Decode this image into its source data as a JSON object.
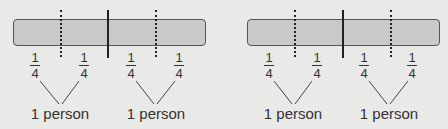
{
  "diagrams": [
    {
      "fractions": [
        {
          "numerator": "1",
          "denominator": "4"
        },
        {
          "numerator": "1",
          "denominator": "4"
        },
        {
          "numerator": "1",
          "denominator": "4"
        },
        {
          "numerator": "1",
          "denominator": "4"
        }
      ],
      "groups": [
        {
          "label": "1 person"
        },
        {
          "label": "1 person"
        }
      ]
    },
    {
      "fractions": [
        {
          "numerator": "1",
          "denominator": "4"
        },
        {
          "numerator": "1",
          "denominator": "4"
        },
        {
          "numerator": "1",
          "denominator": "4"
        },
        {
          "numerator": "1",
          "denominator": "4"
        }
      ],
      "groups": [
        {
          "label": "1 person"
        },
        {
          "label": "1 person"
        }
      ]
    }
  ],
  "colors": {
    "background": "#e9e9e7",
    "bar_fill": "#c9c9c7",
    "bar_border": "#555555",
    "line": "#222222",
    "text": "#333333"
  }
}
